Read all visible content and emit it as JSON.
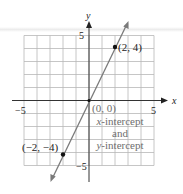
{
  "chart_data": {
    "type": "line",
    "title": "",
    "xlabel": "x",
    "ylabel": "y",
    "xlim": [
      -5,
      5
    ],
    "ylim": [
      -5,
      5
    ],
    "grid": true,
    "x_ticks_labeled": [
      "−5",
      "5"
    ],
    "y_ticks_labeled": [
      "5",
      "−5"
    ],
    "series": [
      {
        "name": "y = 2x",
        "x": [
          -2,
          0,
          2
        ],
        "y": [
          -4,
          0,
          4
        ],
        "color": "#7a7a7a"
      }
    ],
    "points": [
      {
        "x": 2,
        "y": 4,
        "label": "(2, 4)"
      },
      {
        "x": 0,
        "y": 0,
        "label": "(0, 0)"
      },
      {
        "x": -2,
        "y": -4,
        "label": "(−2, −4)"
      }
    ],
    "annotations": [
      "x-intercept",
      "and",
      "y-intercept"
    ]
  },
  "labels": {
    "x_axis": "x",
    "y_axis": "y",
    "x_min_tick": "−5",
    "x_max_tick": "5",
    "y_max_tick": "5",
    "y_min_tick": "−5",
    "point_upper": "(2, 4)",
    "point_origin": "(0, 0)",
    "point_lower": "(−2, −4)",
    "note_line1_var": "x",
    "note_line1_rest": "-intercept",
    "note_line2": "and",
    "note_line3_var": "y",
    "note_line3_rest": "-intercept"
  },
  "colors": {
    "axis": "#333333",
    "grid": "#b8b8b8",
    "line": "#7a7a7a",
    "point": "#111111",
    "annotation": "#6e6e6e"
  }
}
